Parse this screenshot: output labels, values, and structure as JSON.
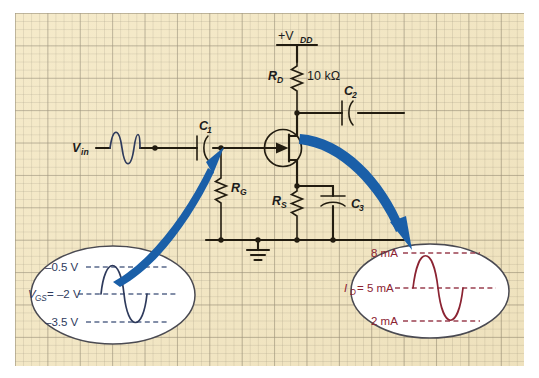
{
  "figure": {
    "paper": {
      "background_color": "#f4e8c4",
      "grid_line_color": "#968c73",
      "canvas_color": "#ffffff"
    },
    "colors": {
      "wire": "#221c10",
      "arrow_blue": "#1a5fa8",
      "input_wave_blue": "#2e3a5c",
      "output_wave_red": "#8b2332",
      "ellipse_fill": "#ffffff",
      "ellipse_stroke": "#4a4a52",
      "dashed_blue": "#5a6a8c",
      "dashed_red": "#9a4050"
    }
  },
  "circuit": {
    "supply": {
      "label": "+V",
      "sub": "DD"
    },
    "drain_resistor": {
      "label": "R",
      "sub": "D",
      "value": "10 kΩ"
    },
    "gate_resistor": {
      "label": "R",
      "sub": "G"
    },
    "source_resistor": {
      "label": "R",
      "sub": "S"
    },
    "input_source": {
      "label": "V",
      "sub": "in"
    },
    "coupling_cap_in": {
      "label": "C",
      "sub": "1"
    },
    "coupling_cap_out": {
      "label": "C",
      "sub": "2"
    },
    "bypass_cap": {
      "label": "C",
      "sub": "3"
    },
    "ground": {
      "name": "ground-symbol"
    },
    "transistor": {
      "name": "n-channel-jfet"
    }
  },
  "callouts": {
    "input": {
      "name": "gate-source-voltage-callout",
      "wave_color": "#2e3a5c",
      "labels": {
        "top": "–0.5 V",
        "middle_prefix": "V",
        "middle_sub": "GS",
        "middle_value": "= –2 V",
        "bottom": "–3.5 V"
      },
      "levels": {
        "top": -0.5,
        "middle": -2,
        "bottom": -3.5,
        "unit": "V"
      }
    },
    "output": {
      "name": "drain-current-callout",
      "wave_color": "#8b2332",
      "labels": {
        "top": "8 mA",
        "middle_prefix": "I",
        "middle_sub": "D",
        "middle_value": "= 5 mA",
        "bottom": "2 mA"
      },
      "levels": {
        "top": 8,
        "middle": 5,
        "bottom": 2,
        "unit": "mA"
      }
    }
  },
  "annotations": {
    "arrow_input": {
      "name": "input-pointer-arrow",
      "color": "#1a5fa8"
    },
    "arrow_output": {
      "name": "output-pointer-arrow",
      "color": "#1a5fa8"
    }
  }
}
